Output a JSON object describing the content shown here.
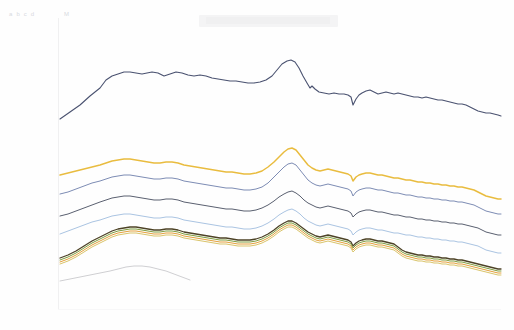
{
  "header": {
    "ghost_label_left": "a b  c d",
    "ghost_label_mid": "M",
    "band_note": ""
  },
  "chart_data": {
    "type": "line",
    "title": "",
    "subtitle": "",
    "xlabel": "",
    "ylabel": "",
    "grid": false,
    "legend_position": "none",
    "xlim": [
      0,
      100
    ],
    "ylim": [
      0,
      100
    ],
    "x_tick_labels": [],
    "y_tick_labels": [],
    "annotations": [
      {
        "name": "central-peak",
        "x": 58,
        "note": "shared sharp peak across all series"
      },
      {
        "name": "downward-notch",
        "x": 69,
        "note": "narrow synchronized dip across all series"
      }
    ],
    "x": [
      0,
      2,
      4,
      6,
      8,
      10,
      12,
      14,
      16,
      18,
      20,
      22,
      24,
      26,
      28,
      30,
      32,
      34,
      36,
      38,
      40,
      42,
      44,
      46,
      48,
      50,
      52,
      54,
      56,
      58,
      60,
      62,
      64,
      66,
      68,
      69,
      70,
      72,
      74,
      76,
      78,
      80,
      82,
      84,
      86,
      88,
      90,
      92,
      94,
      96,
      98,
      100
    ],
    "series": [
      {
        "name": "series-1-navy-top",
        "color": "#4a5270",
        "width": 1.1,
        "values": [
          22,
          26,
          31,
          36,
          41,
          46,
          51,
          56,
          60,
          64,
          67,
          70,
          72,
          73,
          74,
          74,
          73,
          72,
          71,
          71,
          70,
          70,
          71,
          70,
          69,
          69,
          70,
          72,
          76,
          82,
          79,
          73,
          69,
          68,
          67,
          57,
          66,
          67,
          68,
          66,
          65,
          66,
          67,
          66,
          65,
          64,
          63,
          62,
          61,
          60,
          58,
          56
        ]
      },
      {
        "name": "series-2-gold",
        "color": "#e9bc3f",
        "width": 1.5,
        "values": [
          null,
          null,
          null,
          null,
          null,
          null,
          null,
          null,
          null,
          null,
          null,
          null,
          null,
          null,
          null,
          null,
          null,
          null,
          null,
          null,
          null,
          null,
          null,
          null,
          null,
          null,
          null,
          null,
          null,
          null,
          null,
          null,
          null,
          null,
          null,
          null,
          null,
          null,
          null,
          null,
          null,
          null,
          null,
          null,
          null,
          null,
          null,
          null,
          null,
          null,
          null,
          null
        ]
      },
      {
        "name": "series-3-slate-blue",
        "color": "#7d8cb4",
        "width": 1.0,
        "values": [
          null,
          null,
          null,
          null,
          null,
          null,
          null,
          null,
          null,
          null,
          null,
          null,
          null,
          null,
          null,
          null,
          null,
          null,
          null,
          null,
          null,
          null,
          null,
          null,
          null,
          null,
          null,
          null,
          null,
          null,
          null,
          null,
          null,
          null,
          null,
          null,
          null,
          null,
          null,
          null,
          null,
          null,
          null,
          null,
          null,
          null,
          null,
          null,
          null,
          null,
          null,
          null
        ]
      },
      {
        "name": "series-4-dark-grey",
        "color": "#5a6070",
        "width": 1.0,
        "values": [
          null,
          null,
          null,
          null,
          null,
          null,
          null,
          null,
          null,
          null,
          null,
          null,
          null,
          null,
          null,
          null,
          null,
          null,
          null,
          null,
          null,
          null,
          null,
          null,
          null,
          null,
          null,
          null,
          null,
          null,
          null,
          null,
          null,
          null,
          null,
          null,
          null,
          null,
          null,
          null,
          null,
          null,
          null,
          null,
          null,
          null,
          null,
          null,
          null,
          null,
          null,
          null
        ]
      },
      {
        "name": "series-5-light-blue",
        "color": "#aac4e2",
        "width": 1.0,
        "values": [
          null,
          null,
          null,
          null,
          null,
          null,
          null,
          null,
          null,
          null,
          null,
          null,
          null,
          null,
          null,
          null,
          null,
          null,
          null,
          null,
          null,
          null,
          null,
          null,
          null,
          null,
          null,
          null,
          null,
          null,
          null,
          null,
          null,
          null,
          null,
          null,
          null,
          null,
          null,
          null,
          null,
          null,
          null,
          null,
          null,
          null,
          null,
          null,
          null,
          null,
          null,
          null
        ]
      },
      {
        "name": "series-6-dark-olive",
        "color": "#4d4326",
        "width": 1.3,
        "values": [
          null,
          null,
          null,
          null,
          null,
          null,
          null,
          null,
          null,
          null,
          null,
          null,
          null,
          null,
          null,
          null,
          null,
          null,
          null,
          null,
          null,
          null,
          null,
          null,
          null,
          null,
          null,
          null,
          null,
          null,
          null,
          null,
          null,
          null,
          null,
          null,
          null,
          null,
          null,
          null,
          null,
          null,
          null,
          null,
          null,
          null,
          null,
          null,
          null,
          null,
          null,
          null
        ]
      },
      {
        "name": "series-7-green",
        "color": "#7f9c3c",
        "width": 1.0,
        "values": [
          null,
          null,
          null,
          null,
          null,
          null,
          null,
          null,
          null,
          null,
          null,
          null,
          null,
          null,
          null,
          null,
          null,
          null,
          null,
          null,
          null,
          null,
          null,
          null,
          null,
          null,
          null,
          null,
          null,
          null,
          null,
          null,
          null,
          null,
          null,
          null,
          null,
          null,
          null,
          null,
          null,
          null,
          null,
          null,
          null,
          null,
          null,
          null,
          null,
          null,
          null,
          null
        ]
      },
      {
        "name": "series-8-orange",
        "color": "#e4a03c",
        "width": 1.0,
        "values": [
          null,
          null,
          null,
          null,
          null,
          null,
          null,
          null,
          null,
          null,
          null,
          null,
          null,
          null,
          null,
          null,
          null,
          null,
          null,
          null,
          null,
          null,
          null,
          null,
          null,
          null,
          null,
          null,
          null,
          null,
          null,
          null,
          null,
          null,
          null,
          null,
          null,
          null,
          null,
          null,
          null,
          null,
          null,
          null,
          null,
          null,
          null,
          null,
          null,
          null,
          null,
          null
        ]
      },
      {
        "name": "series-9-pale-gold",
        "color": "#d9c46a",
        "width": 1.0,
        "values": [
          null,
          null,
          null,
          null,
          null,
          null,
          null,
          null,
          null,
          null,
          null,
          null,
          null,
          null,
          null,
          null,
          null,
          null,
          null,
          null,
          null,
          null,
          null,
          null,
          null,
          null,
          null,
          null,
          null,
          null,
          null,
          null,
          null,
          null,
          null,
          null,
          null,
          null,
          null,
          null,
          null,
          null,
          null,
          null,
          null,
          null,
          null,
          null,
          null,
          null,
          null,
          null
        ]
      },
      {
        "name": "series-10-faint-grey-partial",
        "color": "#c9cacd",
        "width": 0.9,
        "values": [
          null,
          null,
          null,
          null,
          null,
          null,
          null,
          null,
          null,
          null,
          null,
          null,
          null,
          null,
          null,
          null,
          null,
          null,
          null,
          null,
          null,
          null,
          null,
          null,
          null,
          null,
          null,
          null,
          null,
          null,
          null,
          null,
          null,
          null,
          null,
          null,
          null,
          null,
          null,
          null,
          null,
          null,
          null,
          null,
          null,
          null,
          null,
          null,
          null,
          null,
          null,
          null
        ]
      }
    ],
    "series_paths": {
      "comment": "pixel-space polyline vertices, image coords, used for faithful rendering",
      "series-1-navy-top": "60,119 70,112 80,105 90,96 100,88 106,80 112,76 118,74 124,72 130,72 136,73 142,74 147,73 152,72 158,73 164,76 170,74 176,72 182,73 188,75 194,76 200,75 206,76 212,78 218,79 224,80 230,81 236,81 242,82 248,83 254,83 260,82 266,80 272,76 277,70 282,64 287,61 291,60 295,62 299,68 303,76 307,83 310,88 312,86 315,89 319,92 324,93 329,94 334,93 339,94 344,94 348,95 351,97 353,105 356,99 359,95 362,93 366,91 370,90 374,92 378,94 382,93 386,92 390,93 394,94 398,93 402,94 406,95 410,96 414,97 418,97 422,98 426,97 430,98 434,99 438,100 442,100 446,101 450,102 454,103 458,104 462,104 466,105 470,107 474,109 478,111 482,112 486,113 490,113 494,114 498,115 501,116",
      "series-2-gold": "60,175 68,173 76,171 84,169 92,167 100,165 106,163 112,161 118,160 124,159 130,159 136,160 142,161 148,162 154,163 160,163 166,162 172,162 178,163 184,165 190,166 196,167 202,168 208,169 214,170 220,171 226,172 232,172 238,173 244,174 250,174 256,173 262,171 268,167 274,162 279,157 284,152 288,149 292,148 296,150 300,155 304,160 308,165 312,168 316,170 320,171 324,170 328,169 332,170 336,171 340,172 344,173 348,174 351,176 353,181 356,177 359,175 362,174 366,173 370,173 374,174 378,175 382,175 386,176 390,177 394,178 398,178 402,179 406,180 410,180 414,181 418,182 422,182 426,183 430,183 434,184 438,184 442,185 446,185 450,186 454,186 458,187 462,187 466,188 470,189 474,190 478,192 482,194 486,196 490,197 494,198 498,199 501,199",
      "series-3-slate-blue": "60,194 68,192 76,189 84,186 92,183 100,181 106,179 112,177 118,176 124,175 130,175 136,176 142,177 148,178 154,179 160,179 166,178 172,178 178,179 184,181 190,182 196,183 202,184 208,185 214,186 220,187 226,188 232,188 238,189 244,190 250,190 256,189 262,187 268,183 274,177 279,172 284,167 288,164 292,163 296,165 300,170 304,175 308,180 312,183 316,185 320,186 324,185 328,184 332,185 336,186 340,187 344,188 348,189 351,191 353,196 356,192 359,190 362,189 366,188 370,188 374,189 378,190 382,190 386,191 390,192 394,193 398,193 402,194 406,195 410,195 414,196 418,197 422,197 426,198 430,198 434,199 438,199 442,200 446,200 450,201 454,201 458,202 462,202 466,203 470,204 474,205 478,207 482,209 486,211 490,212 494,213 498,214 501,214",
      "series-4-dark-grey": "60,216 68,214 76,211 84,208 92,205 100,202 106,200 112,198 118,197 124,196 130,196 136,197 142,198 148,199 154,200 160,200 166,199 172,199 178,200 184,202 190,203 196,204 202,205 208,206 214,207 220,208 226,209 232,209 238,210 244,211 250,211 256,210 262,208 268,205 274,201 279,197 284,194 288,192 292,191 296,193 300,196 304,200 308,203 312,205 316,207 320,208 324,207 328,206 332,207 336,208 340,209 344,210 348,211 351,213 353,217 356,214 359,212 362,211 366,210 370,210 374,211 378,212 382,212 386,213 390,214 394,215 398,215 402,216 406,217 410,217 414,218 418,219 422,219 426,220 430,220 434,221 438,221 442,222 446,222 450,223 454,223 458,224 462,224 466,225 470,226 474,227 478,228 482,230 486,232 490,233 494,234 498,235 501,235",
      "series-5-light-blue": "60,234 68,231 76,228 84,225 92,222 100,220 106,218 112,216 118,215 124,214 130,214 136,215 142,216 148,217 154,218 160,218 166,217 172,217 178,218 184,220 190,221 196,222 202,223 208,224 214,225 220,226 226,227 232,227 238,228 244,229 250,229 256,228 262,226 268,223 274,219 279,215 284,212 288,210 292,209 296,211 300,214 304,218 308,221 312,223 316,225 320,226 324,225 328,224 332,225 336,226 340,227 344,228 348,229 351,231 353,235 356,232 359,230 362,229 366,228 370,228 374,229 378,230 382,230 386,231 390,232 394,233 398,233 402,234 406,235 410,235 414,236 418,237 422,237 426,238 430,238 434,239 438,239 442,240 446,240 450,241 454,241 458,242 462,242 466,243 470,244 474,245 478,246 482,248 486,250 490,251 494,252 498,253 501,253",
      "series-6-dark-olive": "60,258 68,255 76,251 84,246 92,241 100,237 106,234 112,231 118,229 124,228 130,227 136,227 142,228 148,229 154,230 160,230 166,229 172,229 178,230 184,232 190,233 196,234 202,235 208,236 214,237 220,238 226,238 232,239 238,240 244,240 250,240 256,239 262,237 268,234 274,230 279,226 284,223 288,221 292,221 296,223 300,226 304,229 308,232 312,234 316,236 320,237 324,236 328,235 332,236 336,237 340,238 344,239 348,240 351,242 353,246 356,243 359,241 362,240 366,239 370,239 374,240 378,241 382,241 386,242 390,243 394,244 398,247 402,250 406,252 410,253 414,254 418,255 422,255 426,256 430,256 434,257 438,257 442,258 446,258 450,259 454,259 458,260 462,260 466,261 470,262 474,263 478,264 482,265 486,266 490,267 494,268 498,269 501,269",
      "series-7-green": "60,260 68,257 76,253 84,248 92,243 100,239 106,236 112,233 118,231 124,230 130,229 136,229 142,230 148,231 154,232 160,232 166,231 172,231 178,232 184,234 190,235 196,236 202,237 208,238 214,239 220,240 226,240 232,241 238,242 244,242 250,242 256,241 262,239 268,236 274,232 279,228 284,225 288,223 292,223 296,225 300,228 304,231 308,234 312,236 316,238 320,239 324,238 328,237 332,238 336,239 340,240 344,241 348,242 351,244 353,248 356,245 359,243 362,242 366,241 370,241 374,242 378,243 382,243 386,244 390,245 394,246 398,249 402,252 406,254 410,255 414,256 418,257 422,257 426,258 430,258 434,259 438,259 442,260 446,260 450,261 454,261 458,262 462,262 466,263 470,264 474,265 478,266 482,267 486,268 490,269 494,270 498,271 501,271",
      "series-8-orange": "60,262 68,259 76,255 84,250 92,245 100,241 106,238 112,235 118,233 124,232 130,231 136,231 142,232 148,233 154,234 160,234 166,233 172,233 178,234 184,236 190,237 196,238 202,239 208,240 214,241 220,242 226,242 232,243 238,244 244,244 250,244 256,243 262,241 268,238 274,234 279,230 284,227 288,225 292,225 296,227 300,230 304,233 308,236 312,238 316,240 320,241 324,240 328,239 332,240 336,241 340,242 344,243 348,244 351,246 353,250 356,247 359,245 362,244 366,243 370,243 374,244 378,245 382,245 386,246 390,247 394,248 398,251 402,254 406,256 410,257 414,258 418,259 422,259 426,260 430,260 434,261 438,261 442,262 446,262 450,263 454,263 458,264 462,264 466,265 470,266 474,267 478,268 482,269 486,270 490,271 494,272 498,273 501,273",
      "series-9-pale-gold": "60,264 68,261 76,257 84,252 92,247 100,243 106,240 112,237 118,235 124,234 130,233 136,233 142,234 148,235 154,236 160,236 166,235 172,235 178,236 184,238 190,239 196,240 202,241 208,242 214,243 220,244 226,244 232,245 238,246 244,246 250,246 256,245 262,243 268,240 274,236 279,232 284,229 288,227 292,227 296,229 300,232 304,235 308,238 312,240 316,242 320,243 324,242 328,241 332,242 336,243 340,244 344,245 348,246 351,248 353,252 356,249 359,247 362,246 366,245 370,245 374,246 378,247 382,247 386,248 390,249 394,250 398,253 402,256 406,258 410,259 414,260 418,261 422,261 426,262 430,262 434,263 438,263 442,264 446,264 450,265 454,265 458,266 462,266 466,267 470,268 474,269 478,270 482,271 486,272 490,273 494,274 498,275 501,275",
      "series-10-faint-grey-partial": "60,281 70,279 80,277 90,275 100,273 110,271 118,269 126,267 134,266 142,266 150,267 158,269 166,271 174,274 182,277 190,280"
    }
  }
}
